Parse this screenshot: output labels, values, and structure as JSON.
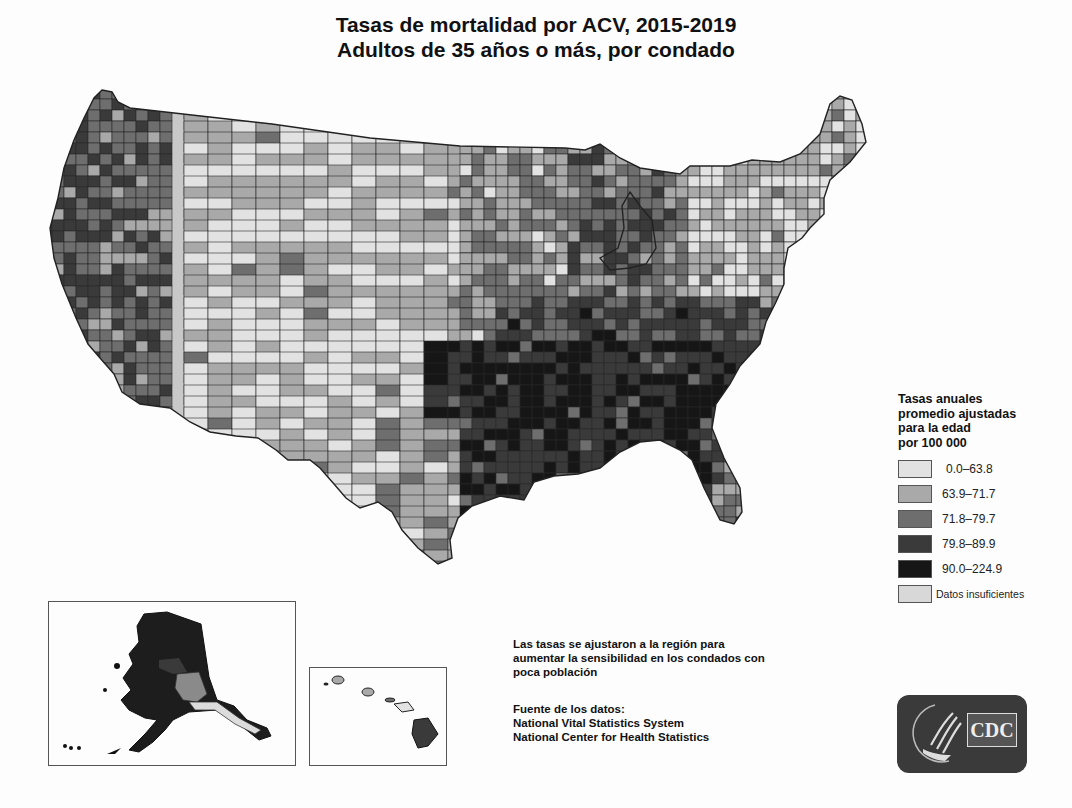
{
  "title": {
    "line1": "Tasas de mortalidad por ACV, 2015-2019",
    "line2": "Adultos de 35 años o más, por condado"
  },
  "legend": {
    "title_lines": [
      "Tasas anuales",
      "promedio ajustadas",
      "para la edad",
      "por 100 000"
    ],
    "items": [
      {
        "label": "0.0–63.8",
        "color": "#e2e2e2"
      },
      {
        "label": "63.9–71.7",
        "color": "#a9a9a9"
      },
      {
        "label": "71.8–79.7",
        "color": "#6e6e6e"
      },
      {
        "label": "79.8–89.9",
        "color": "#3a3a3a"
      },
      {
        "label": "90.0–224.9",
        "color": "#161616"
      },
      {
        "label": "Datos insuficientes",
        "color": "#d8d8d8"
      }
    ]
  },
  "note": {
    "lines": [
      "Las tasas se ajustaron a la región para",
      "aumentar la sensibilidad en los condados con",
      "poca población"
    ]
  },
  "source": {
    "lines": [
      "Fuente de los datos:",
      "National Vital Statistics System",
      "National Center for Health Statistics"
    ]
  },
  "insets": {
    "alaska": "alaska-inset",
    "hawaii": "hawaii-inset"
  },
  "logo": {
    "text": "CDC",
    "icon": "hhs-eagle-icon"
  },
  "chart_data": {
    "type": "choropleth",
    "geography": "US counties (contiguous US + Alaska and Hawaii insets)",
    "legend_title": "Tasas anuales promedio ajustadas para la edad por 100 000",
    "classes": [
      {
        "range": [
          0.0,
          63.8
        ],
        "color": "#e2e2e2"
      },
      {
        "range": [
          63.9,
          71.7
        ],
        "color": "#a9a9a9"
      },
      {
        "range": [
          71.8,
          79.7
        ],
        "color": "#6e6e6e"
      },
      {
        "range": [
          79.8,
          89.9
        ],
        "color": "#3a3a3a"
      },
      {
        "range": [
          90.0,
          224.9
        ],
        "color": "#161616"
      },
      {
        "label": "Datos insuficientes",
        "color": "#d8d8d8"
      }
    ],
    "regional_pattern": {
      "southeast": "predominantly 79.8–224.9 (darkest)",
      "great_plains_mountain_west": "predominantly 0.0–63.8 (lightest)",
      "northeast": "predominantly 0.0–71.7",
      "pacific_northwest_california": "mixed, many 71.8–224.9",
      "alaska": "mostly dark (79.8–224.9), south-central lighter",
      "hawaii": "Big Island dark, other islands light/medium"
    },
    "note": "Las tasas se ajustaron a la región para aumentar la sensibilidad en los condados con poca población",
    "source": "National Vital Statistics System; National Center for Health Statistics"
  }
}
